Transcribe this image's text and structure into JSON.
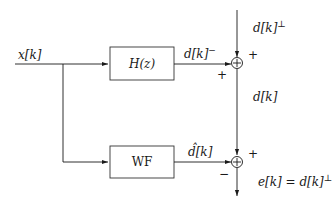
{
  "diagram": {
    "type": "block-diagram",
    "input": {
      "label": "x[k]"
    },
    "blocks": [
      {
        "id": "hz",
        "label": "H(z)"
      },
      {
        "id": "wf",
        "label": "WF"
      }
    ],
    "signals": {
      "h_output": {
        "label": "d[k]",
        "superscript": "−"
      },
      "external_in": {
        "label": "d[k]",
        "superscript": "⊥"
      },
      "sum_output": {
        "label": "d[k]"
      },
      "wf_output": {
        "label": "d̂[k]"
      },
      "final_output": {
        "label": "e[k] = d[k]",
        "superscript": "⊥"
      }
    },
    "summing_junctions": [
      {
        "id": "sum1",
        "symbol": "⊕",
        "signs": {
          "top": "+",
          "left": "+"
        }
      },
      {
        "id": "sum2",
        "symbol": "⊕",
        "signs": {
          "top": "+",
          "left": "−"
        }
      }
    ]
  }
}
